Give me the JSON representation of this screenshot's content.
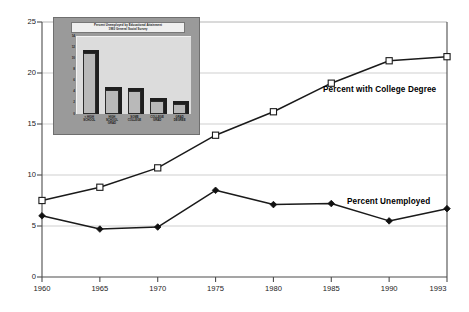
{
  "chart_data": {
    "type": "line",
    "title": "",
    "xlabel": "",
    "ylabel": "",
    "x": [
      1960,
      1965,
      1970,
      1975,
      1980,
      1985,
      1990,
      1993
    ],
    "xtick_labels": [
      "1960",
      "1965",
      "1970",
      "1975",
      "1980",
      "1985",
      "1990",
      "1993"
    ],
    "ytick_labels": [
      "0",
      "5",
      "10",
      "15",
      "20",
      "25"
    ],
    "yticks": [
      0,
      5,
      10,
      15,
      20,
      25
    ],
    "ylim": [
      0,
      25
    ],
    "grid": "horizontal",
    "legend_position": "inline-annotations",
    "series": [
      {
        "name": "Percent with College Degree",
        "marker": "open-square",
        "values": [
          7.5,
          8.8,
          10.7,
          13.9,
          16.2,
          19.0,
          21.2,
          21.6
        ]
      },
      {
        "name": "Percent Unemployed",
        "marker": "filled-diamond",
        "values": [
          6.0,
          4.7,
          4.9,
          8.5,
          7.1,
          7.2,
          5.5,
          6.7
        ]
      }
    ],
    "annotations": [
      {
        "text": "Percent with College Degree",
        "x": 1985,
        "y": 18.5
      },
      {
        "text": "Percent Unemployed",
        "x": 1987,
        "y": 8.2
      }
    ]
  },
  "inset_chart": {
    "type": "bar",
    "title_line1": "Percent Unemployed by Educational Attainment",
    "title_line2": "1993 General Social Survey",
    "categories": [
      "< HIGH\nSCHOOL",
      "HIGH\nSCHOOL\nGRAD",
      "SOME\nCOLLEGE",
      "COLLEGE\nGRAD",
      "GRAD\nDEGREE"
    ],
    "category_labels": [
      "< HIGH SCHOOL",
      "HIGH SCHOOL GRAD",
      "SOME COLLEGE",
      "COLLEGE GRAD",
      "GRAD DEGREE"
    ],
    "values": [
      11.0,
      4.3,
      4.1,
      2.4,
      1.8
    ],
    "ytick_labels": [
      "14",
      "12",
      "10",
      "8",
      "6",
      "4",
      "2",
      "0"
    ],
    "yticks": [
      14,
      12,
      10,
      8,
      6,
      4,
      2,
      0
    ],
    "ylim": [
      0,
      14
    ],
    "xlabel": "",
    "ylabel": "",
    "grid": "off",
    "style": "3d-shadow-bars",
    "panel_color": "#9a9a9a",
    "plot_color": "#dcdcdc",
    "bar_face_color": "#b9b9b9",
    "bar_shadow_color": "#1f1f1f"
  },
  "colors": {
    "background": "#ffffff",
    "axis": "#4d4d4d",
    "gridline": "#c9c9c9",
    "line": "#1a1a1a",
    "marker_fill_open": "#ffffff",
    "marker_fill_solid": "#111111",
    "text": "#1a1a1a"
  }
}
